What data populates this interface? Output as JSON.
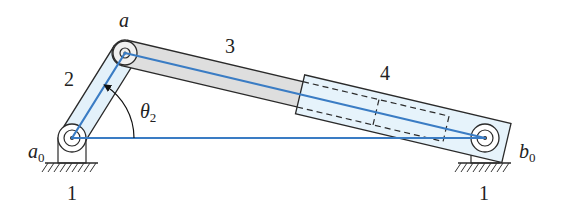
{
  "figure": {
    "type": "inverted slider-crank mechanism",
    "colors": {
      "link_outline": "#2a2a2a",
      "link2_fill": "#e3f1fa",
      "link3_fill": "#dedede",
      "slider_fill": "#e6f3fb",
      "vector_line": "#3a7cc4",
      "ground_hatch": "#333333"
    },
    "labels": {
      "joint_a": "a",
      "joint_a0_base": "a",
      "joint_a0_sub": "0",
      "joint_b0_base": "b",
      "joint_b0_sub": "0",
      "link_1_left": "1",
      "link_1_right": "1",
      "link_2": "2",
      "link_3": "3",
      "link_4": "4",
      "angle_base": "θ",
      "angle_sub": "2"
    },
    "points": {
      "a0": [
        72,
        138
      ],
      "a": [
        125,
        53
      ],
      "b0": [
        485,
        138
      ]
    }
  }
}
